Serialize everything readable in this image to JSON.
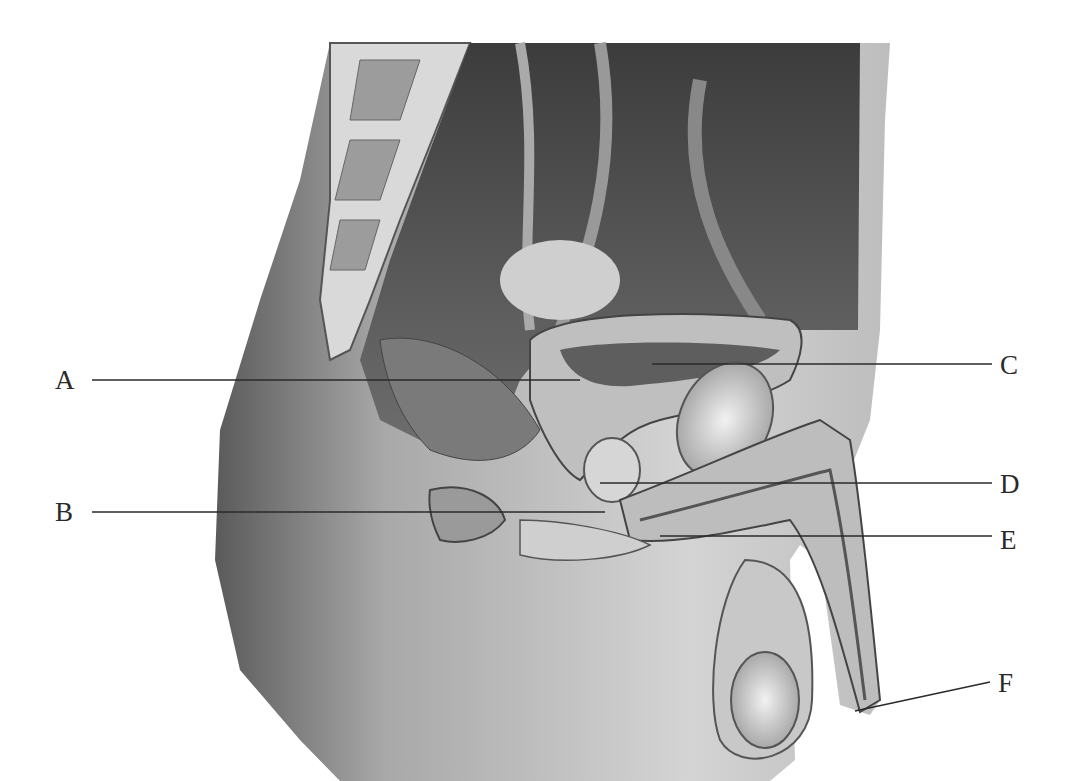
{
  "figure": {
    "type": "anatomical illustration",
    "background": "#ffffff",
    "line_color": "#2a2a2a"
  },
  "labels": [
    {
      "id": "A",
      "text": "A",
      "text_x": 55,
      "text_y": 380,
      "line": [
        92,
        380,
        580,
        380
      ]
    },
    {
      "id": "B",
      "text": "B",
      "text_x": 55,
      "text_y": 512,
      "line": [
        92,
        512,
        605,
        512
      ]
    },
    {
      "id": "C",
      "text": "C",
      "text_x": 1000,
      "text_y": 365,
      "line": [
        652,
        364,
        992,
        364
      ]
    },
    {
      "id": "D",
      "text": "D",
      "text_x": 1000,
      "text_y": 484,
      "line": [
        600,
        483,
        992,
        483
      ]
    },
    {
      "id": "E",
      "text": "E",
      "text_x": 1000,
      "text_y": 540,
      "line": [
        660,
        536,
        992,
        536
      ]
    },
    {
      "id": "F",
      "text": "F",
      "text_x": 998,
      "text_y": 683,
      "line": [
        855,
        711,
        990,
        682
      ]
    }
  ]
}
